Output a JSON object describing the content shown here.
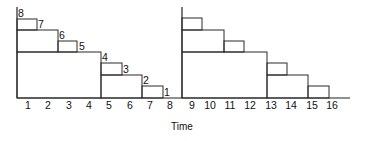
{
  "diagram": {
    "type": "staircase-timeline",
    "x_axis_title": "Time",
    "tick_labels": [
      "1",
      "2",
      "3",
      "4",
      "5",
      "6",
      "7",
      "8",
      "9",
      "10",
      "11",
      "12",
      "13",
      "14",
      "15",
      "16"
    ],
    "panels": [
      {
        "name": "left-panel",
        "time_range": [
          1,
          8
        ],
        "labeled_steps": [
          "8",
          "7",
          "6",
          "5",
          "4",
          "3",
          "2",
          "1"
        ]
      },
      {
        "name": "right-panel",
        "time_range": [
          9,
          16
        ],
        "labeled_steps": []
      }
    ],
    "colors": {
      "line": "#2a2a2a",
      "text": "#111111",
      "background": "#ffffff"
    }
  },
  "geometry": {
    "baseline_y": 98,
    "axis_top_y": 7,
    "left_axis_x": 17,
    "right_axis_x": 182,
    "baseline_end_x": 350,
    "tick_label_y": 109,
    "tick_label_x": [
      28,
      48,
      69,
      89,
      109,
      130,
      150,
      170,
      192,
      210,
      230,
      250,
      271,
      291,
      312,
      332
    ],
    "axis_title_pos": [
      182,
      130
    ],
    "left_boxes": [
      {
        "x1": 17,
        "y1": 52,
        "x2": 101,
        "y2": 98
      },
      {
        "x1": 17,
        "y1": 30,
        "x2": 58,
        "y2": 52
      },
      {
        "x1": 17,
        "y1": 19,
        "x2": 37,
        "y2": 30
      },
      {
        "x1": 58,
        "y1": 41,
        "x2": 77,
        "y2": 52
      },
      {
        "x1": 101,
        "y1": 75,
        "x2": 142,
        "y2": 98
      },
      {
        "x1": 101,
        "y1": 63,
        "x2": 122,
        "y2": 75
      },
      {
        "x1": 142,
        "y1": 86,
        "x2": 163,
        "y2": 98
      }
    ],
    "right_boxes": [
      {
        "x1": 182,
        "y1": 52,
        "x2": 267,
        "y2": 98
      },
      {
        "x1": 182,
        "y1": 30,
        "x2": 224,
        "y2": 52
      },
      {
        "x1": 182,
        "y1": 18,
        "x2": 202,
        "y2": 30
      },
      {
        "x1": 224,
        "y1": 41,
        "x2": 244,
        "y2": 52
      },
      {
        "x1": 267,
        "y1": 75,
        "x2": 308,
        "y2": 98
      },
      {
        "x1": 267,
        "y1": 63,
        "x2": 287,
        "y2": 75
      },
      {
        "x1": 308,
        "y1": 86,
        "x2": 329,
        "y2": 98
      }
    ],
    "step_label_pos": [
      {
        "x": 18,
        "y": 17
      },
      {
        "x": 38,
        "y": 28
      },
      {
        "x": 59,
        "y": 39
      },
      {
        "x": 79,
        "y": 50
      },
      {
        "x": 102,
        "y": 61
      },
      {
        "x": 123,
        "y": 73
      },
      {
        "x": 143,
        "y": 84
      },
      {
        "x": 164,
        "y": 96
      }
    ]
  }
}
